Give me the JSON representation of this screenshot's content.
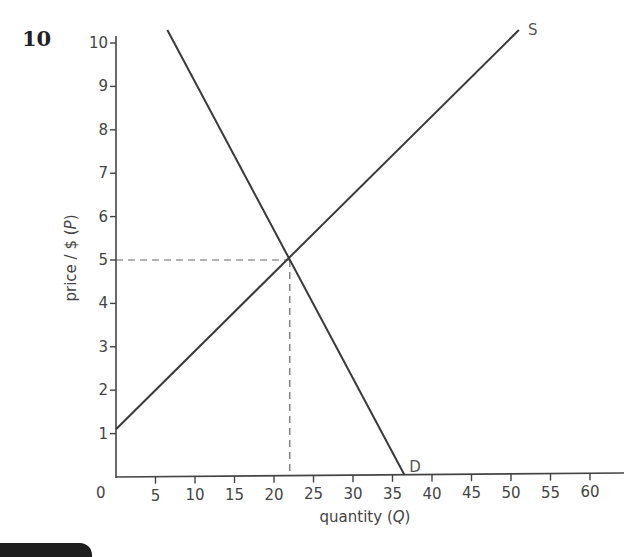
{
  "question_number": "10",
  "chart_data": {
    "type": "line",
    "title": "",
    "xlabel": "quantity (Q)",
    "ylabel": "price / $ (P)",
    "xlabel_plain": "quantity (",
    "xlabel_var": "Q",
    "xlabel_close": ")",
    "ylabel_plain": "price / $ (",
    "ylabel_var": "P",
    "ylabel_close": ")",
    "xlim": [
      0,
      64
    ],
    "ylim": [
      0,
      10.5
    ],
    "origin_label": "0",
    "x_ticks": [
      5,
      10,
      15,
      20,
      25,
      30,
      35,
      40,
      45,
      50,
      55,
      60
    ],
    "y_ticks": [
      1,
      2,
      3,
      4,
      5,
      6,
      7,
      8,
      9,
      10
    ],
    "grid": false,
    "series": [
      {
        "name": "S",
        "label": "S",
        "kind": "supply",
        "points": [
          [
            0,
            1.1
          ],
          [
            51,
            10.3
          ]
        ]
      },
      {
        "name": "D",
        "label": "D",
        "kind": "demand",
        "points": [
          [
            6.5,
            10.3
          ],
          [
            36.5,
            0
          ]
        ]
      }
    ],
    "equilibrium": {
      "Q": 22,
      "P": 5,
      "guide_lines": "dashed"
    }
  }
}
